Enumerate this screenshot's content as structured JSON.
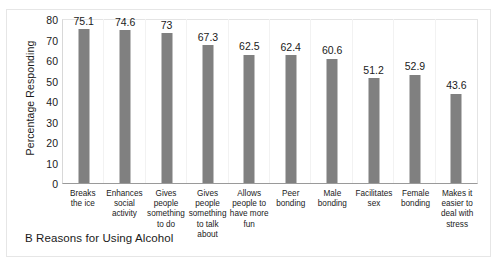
{
  "caption": "B Reasons for Using Alcohol",
  "chart_data": {
    "type": "bar",
    "title": "B Reasons for Using Alcohol",
    "xlabel": "",
    "ylabel": "Percentage Responding",
    "ylim": [
      0,
      80
    ],
    "ytick_step": 10,
    "yticks": [
      "80",
      "70",
      "60",
      "50",
      "40",
      "30",
      "20",
      "10",
      "0"
    ],
    "grid": false,
    "legend": "none",
    "bar_color": "#808080",
    "categories": [
      "Breaks the ice",
      "Enhances social activity",
      "Gives people something to do",
      "Gives people something to talk about",
      "Allows people to have more fun",
      "Peer bonding",
      "Male bonding",
      "Facilitates sex",
      "Female bonding",
      "Makes it easier to deal with stress"
    ],
    "category_lines": [
      [
        "Breaks",
        "the ice"
      ],
      [
        "Enhances",
        "social",
        "activity"
      ],
      [
        "Gives",
        "people",
        "something",
        "to do"
      ],
      [
        "Gives",
        "people",
        "something",
        "to talk about"
      ],
      [
        "Allows",
        "people to",
        "have more",
        "fun"
      ],
      [
        "Peer",
        "bonding"
      ],
      [
        "Male",
        "bonding"
      ],
      [
        "Facilitates",
        "sex"
      ],
      [
        "Female",
        "bonding"
      ],
      [
        "Makes it",
        "easier to",
        "deal with",
        "stress"
      ]
    ],
    "values": [
      75.1,
      74.6,
      73,
      67.3,
      62.5,
      62.4,
      60.6,
      51.2,
      52.9,
      43.6
    ],
    "value_labels": [
      "75.1",
      "74.6",
      "73",
      "67.3",
      "62.5",
      "62.4",
      "60.6",
      "51.2",
      "52.9",
      "43.6"
    ]
  }
}
